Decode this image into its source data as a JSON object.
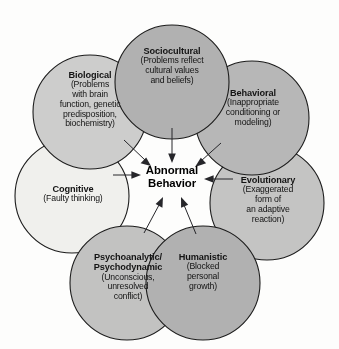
{
  "diagram": {
    "type": "venn-overlap-model",
    "title_center": {
      "line1": "Abnormal",
      "line2": "Behavior"
    },
    "background_color": "#fdfdfc",
    "outline_color": "#1c1c1c",
    "arrow_color": "#26262a",
    "arrow_count": 7,
    "arrow_direction": "inward-to-center",
    "perspectives": [
      {
        "id": "sociocultural",
        "title": "Sociocultural",
        "desc": "(Problems reflect\ncultural values\nand beliefs)",
        "desc_lines": [
          "(Problems reflect",
          "cultural values",
          "and beliefs)"
        ],
        "fill": "#b3b3b3",
        "cx": 172,
        "cy": 82,
        "r": 57
      },
      {
        "id": "biological",
        "title": "Biological",
        "desc_lines": [
          "(Problems",
          "with brain",
          "function, genetic",
          "predisposition,",
          "biochemistry)"
        ],
        "fill": "#cfcfcf",
        "cx": 90,
        "cy": 112,
        "r": 57
      },
      {
        "id": "behavioral",
        "title": "Behavioral",
        "desc_lines": [
          "(Inappropriate",
          "conditioning or",
          "modeling)"
        ],
        "fill": "#b9b9b9",
        "cx": 252,
        "cy": 118,
        "r": 57
      },
      {
        "id": "evolutionary",
        "title": "Evolutionary",
        "desc_lines": [
          "(Exaggerated",
          "form of",
          "an adaptive",
          "reaction)"
        ],
        "fill": "#c6c6c6",
        "cx": 267,
        "cy": 203,
        "r": 57
      },
      {
        "id": "humanistic",
        "title": "Humanistic",
        "desc_lines": [
          "(Blocked",
          "personal",
          "growth)"
        ],
        "fill": "#b3b3b3",
        "cx": 203,
        "cy": 283,
        "r": 57
      },
      {
        "id": "psychoanalytic",
        "title": "Psychoanalytic/\nPsychodynamic",
        "title_lines": [
          "Psychoanalytic/",
          "Psychodynamic"
        ],
        "desc_lines": [
          "(Unconscious,",
          "unresolved",
          "conflict)"
        ],
        "fill": "#c4c4c4",
        "cx": 127,
        "cy": 283,
        "r": 57
      },
      {
        "id": "cognitive",
        "title": "Cognitive",
        "desc_lines": [
          "(Faulty thinking)"
        ],
        "fill": "#f2f2f0",
        "cx": 72,
        "cy": 196,
        "r": 57
      }
    ]
  }
}
